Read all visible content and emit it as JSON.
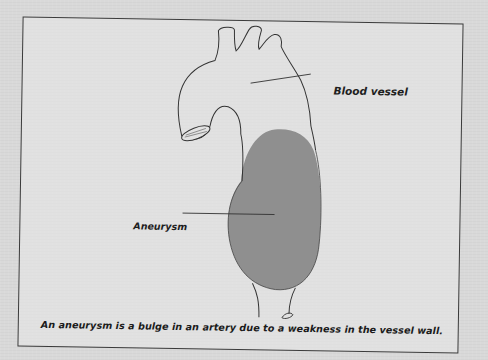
{
  "figure": {
    "labels": {
      "blood_vessel": "Blood vessel",
      "aneurysm": "Aneurysm"
    },
    "caption": "An aneurysm is a bulge in an artery due to a weakness in the vessel wall.",
    "colors": {
      "background": "#d9d9d9",
      "frame_border": "#3a3a3a",
      "vessel_outline": "#333333",
      "aneurysm_fill": "#8f8f8f",
      "text": "#1e1e1e"
    }
  }
}
